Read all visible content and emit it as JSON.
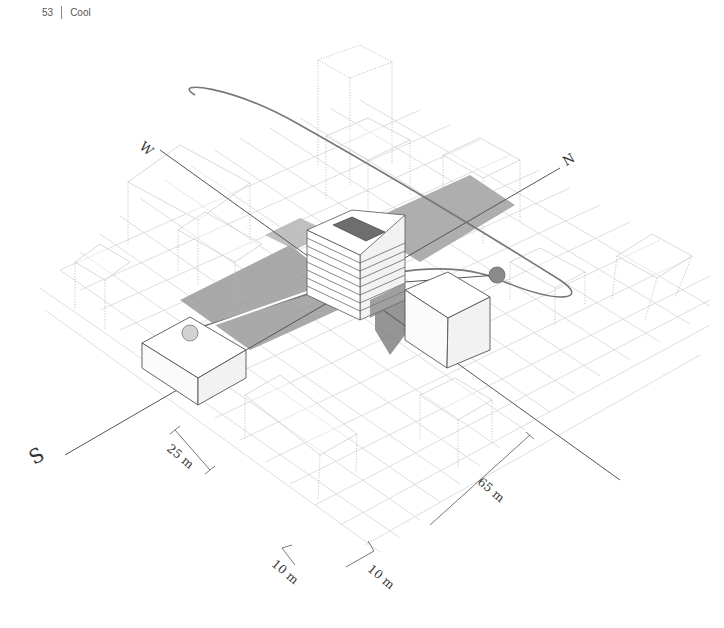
{
  "header": {
    "page_number": "53",
    "section_title": "Cool"
  },
  "diagram": {
    "type": "axonometric-sun-study",
    "compass": {
      "north": "N",
      "south": "S",
      "west": "W"
    },
    "dimensions": {
      "block_width": "25 m",
      "site_length": "65 m",
      "street_width_a": "10 m",
      "street_width_b": "10 m"
    },
    "sun_positions": [
      {
        "name": "low-sun",
        "color": "#d2d2d2"
      },
      {
        "name": "high-sun",
        "color": "#8a8a8a"
      }
    ],
    "colors": {
      "shadow": "#9a9a9a",
      "shadow_light": "#b8b8b8",
      "grid": "#d6d6d6",
      "outline": "#555555",
      "ghost_outline": "#b5b5b5"
    }
  }
}
